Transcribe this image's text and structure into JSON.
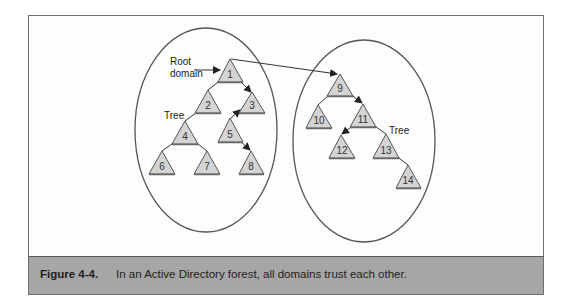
{
  "figure": {
    "caption_label": "Figure 4-4.",
    "caption_text": "In an Active Directory forest, all domains trust each other."
  },
  "diagram": {
    "labels": {
      "root_domain_line1": "Root",
      "root_domain_line2": "domain",
      "tree_left": "Tree",
      "tree_right": "Tree"
    },
    "colors": {
      "triangle_fill": "#d4d4d4",
      "triangle_stroke": "#555555",
      "line": "#333333",
      "caption_bg": "#a6a6a6"
    },
    "trees": [
      {
        "name": "left-tree",
        "nodes": [
          "1",
          "2",
          "3",
          "4",
          "5",
          "6",
          "7",
          "8"
        ]
      },
      {
        "name": "right-tree",
        "nodes": [
          "9",
          "10",
          "11",
          "12",
          "13",
          "14"
        ]
      }
    ],
    "node_labels": {
      "n1": "1",
      "n2": "2",
      "n3": "3",
      "n4": "4",
      "n5": "5",
      "n6": "6",
      "n7": "7",
      "n8": "8",
      "n9": "9",
      "n10": "10",
      "n11": "11",
      "n12": "12",
      "n13": "13",
      "n14": "14"
    }
  }
}
